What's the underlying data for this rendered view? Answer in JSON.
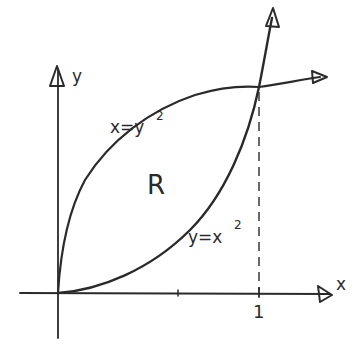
{
  "diagram": {
    "type": "region-between-curves",
    "axes": {
      "x_label": "x",
      "y_label": "y",
      "tick_label_x1": "1"
    },
    "curves": [
      {
        "name": "upper",
        "equation_label": "x=y",
        "exponent": "2"
      },
      {
        "name": "lower",
        "equation_label": "y=x",
        "exponent": "2"
      }
    ],
    "region_label": "R",
    "colors": {
      "ink": "#2a2a2a",
      "background": "#ffffff"
    }
  }
}
